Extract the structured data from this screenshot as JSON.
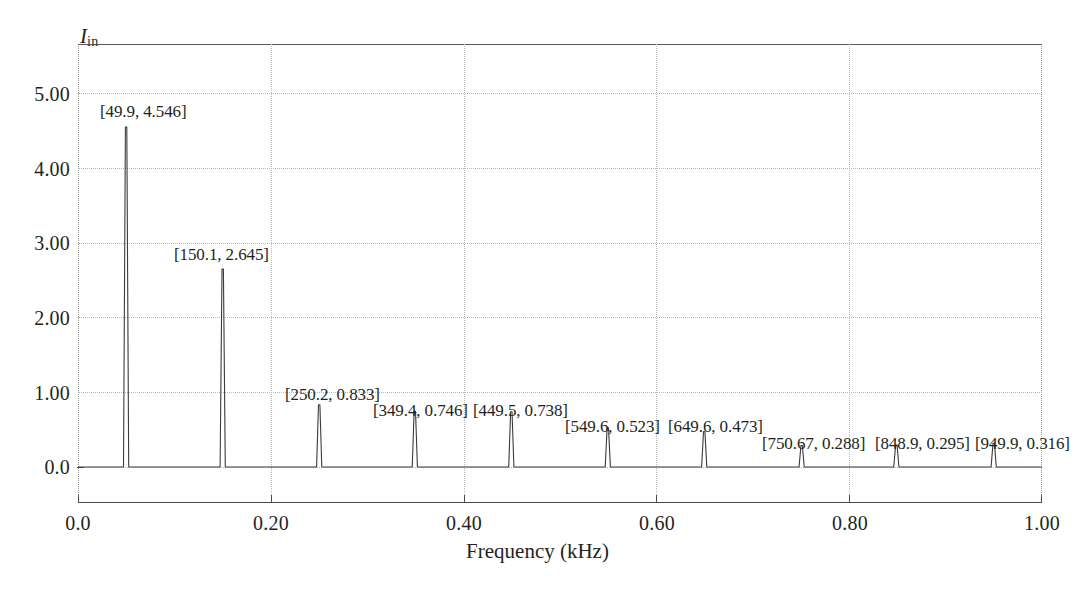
{
  "axes": {
    "y_title_main": "I",
    "y_title_sub": "in",
    "x_title": "Frequency (kHz)",
    "y_ticks": [
      "5.00",
      "4.00",
      "3.00",
      "2.00",
      "1.00",
      "0.0"
    ],
    "x_ticks": [
      "0.0",
      "0.20",
      "0.40",
      "0.60",
      "0.80",
      "1.00"
    ]
  },
  "annotations": [
    {
      "text": "[49.9, 4.546]"
    },
    {
      "text": "[150.1, 2.645]"
    },
    {
      "text": "[250.2, 0.833]"
    },
    {
      "text": "[349.4, 0.746]"
    },
    {
      "text": "[449.5, 0.738]"
    },
    {
      "text": "[549.6, 0.523]"
    },
    {
      "text": "[649.6, 0.473]"
    },
    {
      "text": "[750.67, 0.288]"
    },
    {
      "text": "[848.9, 0.295]"
    },
    {
      "text": "[949.9, 0.316]"
    }
  ],
  "colors": {
    "trace": "#3b3b3b",
    "grid": "#b9b9b9",
    "frame": "#4a4a4a",
    "text": "#231f20",
    "background": "#ffffff"
  },
  "chart_data": {
    "type": "line",
    "title": "",
    "xlabel": "Frequency (kHz)",
    "ylabel": "I_in",
    "xlim": [
      0.0,
      1.0
    ],
    "ylim": [
      -0.12,
      6.02
    ],
    "grid": true,
    "legend": "none",
    "x_tick_values": [
      0.0,
      0.2,
      0.4,
      0.6,
      0.8,
      1.0
    ],
    "y_tick_values": [
      0.0,
      1.0,
      2.0,
      3.0,
      4.0,
      5.0
    ],
    "series": [
      {
        "name": "I_in spectrum",
        "x_unit": "kHz",
        "x": [
          0.0499,
          0.1501,
          0.2502,
          0.3494,
          0.4495,
          0.5496,
          0.6496,
          0.75067,
          0.8489,
          0.9499
        ],
        "values": [
          4.546,
          2.645,
          0.833,
          0.746,
          0.738,
          0.523,
          0.473,
          0.288,
          0.295,
          0.316
        ],
        "point_labels": [
          "[49.9, 4.546]",
          "[150.1, 2.645]",
          "[250.2, 0.833]",
          "[349.4, 0.746]",
          "[449.5, 0.738]",
          "[549.6, 0.523]",
          "[649.6, 0.473]",
          "[750.67, 0.288]",
          "[848.9, 0.295]",
          "[949.9, 0.316]"
        ],
        "frequencies_hz": [
          49.9,
          150.1,
          250.2,
          349.4,
          449.5,
          549.6,
          649.6,
          750.67,
          848.9,
          949.9
        ]
      }
    ]
  }
}
